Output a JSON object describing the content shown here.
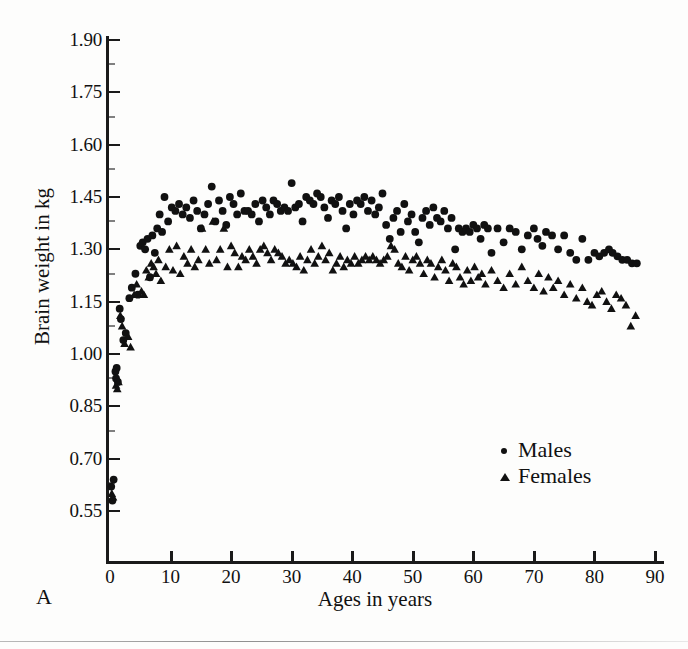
{
  "figure": {
    "panel_label": "A",
    "background_color": "#fdfdfc",
    "ink_color": "#111111"
  },
  "chart_data": {
    "type": "scatter",
    "title": "",
    "xlabel": "Ages in years",
    "ylabel": "Brain weight in kg",
    "xlim": [
      0,
      92
    ],
    "ylim": [
      0.48,
      1.95
    ],
    "grid": false,
    "legend_position": "inside-lower-right",
    "xticks": [
      0,
      10,
      20,
      30,
      40,
      50,
      60,
      70,
      80,
      90
    ],
    "xticklabels": [
      "0",
      "10",
      "20",
      "30",
      "40",
      "50",
      "60",
      "70",
      "80",
      "90"
    ],
    "yticks": [
      0.55,
      0.7,
      0.85,
      1.0,
      1.15,
      1.3,
      1.45,
      1.6,
      1.75,
      1.9
    ],
    "yticklabels": [
      "0.55",
      "0.70",
      "0.85",
      "1.00",
      "1.15",
      "1.30",
      "1.45",
      "1.60",
      "1.75",
      "1.90"
    ],
    "series": [
      {
        "name": "Males",
        "marker": "circle",
        "color": "#111111",
        "points": [
          [
            0.2,
            0.62
          ],
          [
            0.4,
            0.58
          ],
          [
            0.6,
            0.64
          ],
          [
            0.9,
            0.95
          ],
          [
            1.0,
            0.93
          ],
          [
            1.1,
            0.96
          ],
          [
            1.3,
            0.92
          ],
          [
            1.6,
            1.13
          ],
          [
            1.8,
            1.1
          ],
          [
            2.2,
            1.04
          ],
          [
            2.6,
            1.06
          ],
          [
            3.2,
            1.16
          ],
          [
            3.6,
            1.19
          ],
          [
            4.2,
            1.23
          ],
          [
            4.6,
            1.17
          ],
          [
            5.0,
            1.31
          ],
          [
            5.4,
            1.32
          ],
          [
            5.8,
            1.3
          ],
          [
            6.2,
            1.33
          ],
          [
            6.6,
            1.22
          ],
          [
            7.0,
            1.34
          ],
          [
            7.4,
            1.29
          ],
          [
            7.8,
            1.36
          ],
          [
            8.2,
            1.4
          ],
          [
            8.6,
            1.35
          ],
          [
            9.0,
            1.45
          ],
          [
            9.6,
            1.38
          ],
          [
            10.2,
            1.42
          ],
          [
            10.8,
            1.41
          ],
          [
            11.4,
            1.43
          ],
          [
            12.0,
            1.4
          ],
          [
            12.6,
            1.42
          ],
          [
            13.2,
            1.39
          ],
          [
            13.8,
            1.44
          ],
          [
            14.4,
            1.41
          ],
          [
            15.0,
            1.36
          ],
          [
            15.6,
            1.4
          ],
          [
            16.2,
            1.43
          ],
          [
            16.8,
            1.48
          ],
          [
            17.4,
            1.38
          ],
          [
            18.0,
            1.44
          ],
          [
            18.6,
            1.41
          ],
          [
            19.2,
            1.37
          ],
          [
            19.8,
            1.45
          ],
          [
            20.4,
            1.43
          ],
          [
            21.0,
            1.4
          ],
          [
            21.6,
            1.46
          ],
          [
            22.2,
            1.41
          ],
          [
            22.8,
            1.41
          ],
          [
            23.4,
            1.4
          ],
          [
            24.0,
            1.43
          ],
          [
            24.6,
            1.38
          ],
          [
            25.2,
            1.44
          ],
          [
            25.8,
            1.42
          ],
          [
            26.4,
            1.4
          ],
          [
            27.0,
            1.44
          ],
          [
            27.6,
            1.43
          ],
          [
            28.2,
            1.41
          ],
          [
            28.8,
            1.42
          ],
          [
            29.4,
            1.41
          ],
          [
            30.0,
            1.49
          ],
          [
            30.6,
            1.42
          ],
          [
            31.2,
            1.43
          ],
          [
            31.8,
            1.38
          ],
          [
            32.4,
            1.45
          ],
          [
            33.0,
            1.44
          ],
          [
            33.6,
            1.43
          ],
          [
            34.2,
            1.46
          ],
          [
            34.8,
            1.45
          ],
          [
            35.4,
            1.42
          ],
          [
            36.0,
            1.39
          ],
          [
            36.6,
            1.44
          ],
          [
            37.2,
            1.43
          ],
          [
            37.8,
            1.45
          ],
          [
            38.4,
            1.41
          ],
          [
            39.0,
            1.36
          ],
          [
            39.6,
            1.43
          ],
          [
            40.2,
            1.4
          ],
          [
            40.8,
            1.44
          ],
          [
            41.4,
            1.43
          ],
          [
            42.0,
            1.45
          ],
          [
            42.6,
            1.41
          ],
          [
            43.2,
            1.44
          ],
          [
            43.8,
            1.4
          ],
          [
            44.4,
            1.42
          ],
          [
            45.0,
            1.46
          ],
          [
            45.6,
            1.37
          ],
          [
            46.2,
            1.33
          ],
          [
            46.8,
            1.39
          ],
          [
            47.4,
            1.41
          ],
          [
            48.0,
            1.35
          ],
          [
            48.6,
            1.43
          ],
          [
            49.2,
            1.38
          ],
          [
            49.8,
            1.4
          ],
          [
            50.4,
            1.35
          ],
          [
            51.0,
            1.32
          ],
          [
            51.6,
            1.39
          ],
          [
            52.2,
            1.41
          ],
          [
            52.8,
            1.37
          ],
          [
            53.4,
            1.42
          ],
          [
            54.0,
            1.39
          ],
          [
            54.6,
            1.38
          ],
          [
            55.2,
            1.41
          ],
          [
            55.8,
            1.36
          ],
          [
            56.4,
            1.39
          ],
          [
            57.0,
            1.3
          ],
          [
            57.6,
            1.36
          ],
          [
            58.2,
            1.35
          ],
          [
            58.8,
            1.36
          ],
          [
            59.4,
            1.35
          ],
          [
            60.0,
            1.37
          ],
          [
            60.6,
            1.36
          ],
          [
            61.2,
            1.33
          ],
          [
            61.8,
            1.37
          ],
          [
            62.4,
            1.36
          ],
          [
            63.0,
            1.29
          ],
          [
            64.0,
            1.36
          ],
          [
            65.0,
            1.32
          ],
          [
            66.0,
            1.36
          ],
          [
            67.0,
            1.35
          ],
          [
            68.0,
            1.3
          ],
          [
            69.0,
            1.34
          ],
          [
            70.0,
            1.36
          ],
          [
            70.6,
            1.33
          ],
          [
            71.4,
            1.31
          ],
          [
            72.0,
            1.35
          ],
          [
            73.0,
            1.34
          ],
          [
            74.0,
            1.3
          ],
          [
            75.0,
            1.34
          ],
          [
            76.0,
            1.29
          ],
          [
            77.0,
            1.27
          ],
          [
            78.0,
            1.33
          ],
          [
            79.0,
            1.27
          ],
          [
            80.0,
            1.29
          ],
          [
            80.8,
            1.28
          ],
          [
            81.6,
            1.29
          ],
          [
            82.4,
            1.3
          ],
          [
            83.0,
            1.29
          ],
          [
            83.8,
            1.28
          ],
          [
            84.6,
            1.27
          ],
          [
            85.4,
            1.27
          ],
          [
            86.2,
            1.26
          ],
          [
            87.0,
            1.26
          ]
        ]
      },
      {
        "name": "Females",
        "marker": "triangle",
        "color": "#111111",
        "points": [
          [
            0.3,
            0.6
          ],
          [
            0.5,
            0.59
          ],
          [
            1.0,
            0.91
          ],
          [
            1.2,
            0.9
          ],
          [
            1.4,
            0.92
          ],
          [
            1.7,
            1.11
          ],
          [
            2.0,
            1.08
          ],
          [
            2.4,
            1.03
          ],
          [
            3.0,
            1.05
          ],
          [
            3.4,
            1.02
          ],
          [
            4.0,
            1.17
          ],
          [
            4.4,
            1.2
          ],
          [
            5.2,
            1.18
          ],
          [
            5.6,
            1.17
          ],
          [
            6.0,
            1.24
          ],
          [
            6.4,
            1.22
          ],
          [
            6.8,
            1.26
          ],
          [
            7.2,
            1.25
          ],
          [
            7.6,
            1.23
          ],
          [
            8.0,
            1.27
          ],
          [
            8.4,
            1.21
          ],
          [
            9.2,
            1.25
          ],
          [
            9.8,
            1.3
          ],
          [
            10.4,
            1.24
          ],
          [
            11.0,
            1.31
          ],
          [
            11.6,
            1.23
          ],
          [
            12.2,
            1.28
          ],
          [
            12.8,
            1.26
          ],
          [
            13.4,
            1.3
          ],
          [
            14.0,
            1.25
          ],
          [
            14.6,
            1.27
          ],
          [
            15.2,
            1.36
          ],
          [
            15.8,
            1.3
          ],
          [
            16.4,
            1.26
          ],
          [
            17.0,
            1.38
          ],
          [
            17.6,
            1.27
          ],
          [
            18.2,
            1.3
          ],
          [
            18.8,
            1.36
          ],
          [
            19.4,
            1.25
          ],
          [
            20.0,
            1.31
          ],
          [
            20.6,
            1.29
          ],
          [
            21.2,
            1.25
          ],
          [
            21.8,
            1.28
          ],
          [
            22.4,
            1.27
          ],
          [
            23.0,
            1.3
          ],
          [
            23.6,
            1.28
          ],
          [
            24.2,
            1.26
          ],
          [
            24.8,
            1.3
          ],
          [
            25.4,
            1.31
          ],
          [
            26.0,
            1.29
          ],
          [
            26.6,
            1.27
          ],
          [
            27.2,
            1.3
          ],
          [
            27.8,
            1.29
          ],
          [
            28.4,
            1.28
          ],
          [
            29.0,
            1.26
          ],
          [
            29.6,
            1.27
          ],
          [
            30.2,
            1.26
          ],
          [
            30.8,
            1.25
          ],
          [
            31.4,
            1.28
          ],
          [
            32.0,
            1.24
          ],
          [
            32.6,
            1.27
          ],
          [
            33.2,
            1.3
          ],
          [
            33.8,
            1.26
          ],
          [
            34.4,
            1.28
          ],
          [
            35.0,
            1.31
          ],
          [
            35.6,
            1.27
          ],
          [
            36.2,
            1.29
          ],
          [
            36.8,
            1.24
          ],
          [
            37.4,
            1.26
          ],
          [
            38.0,
            1.28
          ],
          [
            38.6,
            1.25
          ],
          [
            39.2,
            1.27
          ],
          [
            39.8,
            1.26
          ],
          [
            40.4,
            1.28
          ],
          [
            41.0,
            1.26
          ],
          [
            41.6,
            1.27
          ],
          [
            42.2,
            1.28
          ],
          [
            42.8,
            1.27
          ],
          [
            43.4,
            1.28
          ],
          [
            44.0,
            1.27
          ],
          [
            44.6,
            1.26
          ],
          [
            45.2,
            1.27
          ],
          [
            45.8,
            1.28
          ],
          [
            46.4,
            1.31
          ],
          [
            47.0,
            1.3
          ],
          [
            47.6,
            1.26
          ],
          [
            48.2,
            1.25
          ],
          [
            48.8,
            1.28
          ],
          [
            49.4,
            1.24
          ],
          [
            50.0,
            1.27
          ],
          [
            50.6,
            1.28
          ],
          [
            51.2,
            1.26
          ],
          [
            51.8,
            1.23
          ],
          [
            52.4,
            1.27
          ],
          [
            53.0,
            1.26
          ],
          [
            53.6,
            1.22
          ],
          [
            54.2,
            1.25
          ],
          [
            54.8,
            1.27
          ],
          [
            55.4,
            1.24
          ],
          [
            56.0,
            1.21
          ],
          [
            56.6,
            1.26
          ],
          [
            57.2,
            1.25
          ],
          [
            57.8,
            1.22
          ],
          [
            58.4,
            1.2
          ],
          [
            59.0,
            1.24
          ],
          [
            59.6,
            1.21
          ],
          [
            60.2,
            1.25
          ],
          [
            60.8,
            1.22
          ],
          [
            61.4,
            1.23
          ],
          [
            62.0,
            1.2
          ],
          [
            63.0,
            1.24
          ],
          [
            64.0,
            1.21
          ],
          [
            65.0,
            1.19
          ],
          [
            66.0,
            1.23
          ],
          [
            67.0,
            1.2
          ],
          [
            68.0,
            1.25
          ],
          [
            69.0,
            1.21
          ],
          [
            70.0,
            1.19
          ],
          [
            70.8,
            1.23
          ],
          [
            71.6,
            1.18
          ],
          [
            72.4,
            1.22
          ],
          [
            73.2,
            1.19
          ],
          [
            74.0,
            1.21
          ],
          [
            75.0,
            1.17
          ],
          [
            76.0,
            1.2
          ],
          [
            77.0,
            1.16
          ],
          [
            78.0,
            1.19
          ],
          [
            78.8,
            1.15
          ],
          [
            79.6,
            1.14
          ],
          [
            80.4,
            1.17
          ],
          [
            81.2,
            1.18
          ],
          [
            82.0,
            1.15
          ],
          [
            82.8,
            1.13
          ],
          [
            83.6,
            1.17
          ],
          [
            84.4,
            1.16
          ],
          [
            85.2,
            1.14
          ],
          [
            86.0,
            1.08
          ],
          [
            86.8,
            1.11
          ]
        ]
      }
    ]
  },
  "legend": {
    "entries": [
      {
        "label": "Males",
        "marker": "circle"
      },
      {
        "label": "Females",
        "marker": "triangle"
      }
    ]
  }
}
